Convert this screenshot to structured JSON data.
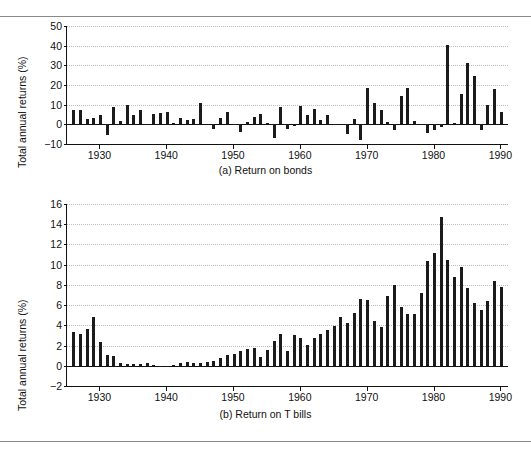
{
  "page": {
    "header_remnant": "",
    "background": "#ffffff",
    "bar_color": "#1b1b1b",
    "grid_color": "#bdbdbd",
    "axis_color": "#111111"
  },
  "chart_data": [
    {
      "id": "return-on-bonds",
      "type": "bar",
      "title": "",
      "caption": "(a)  Return on bonds",
      "xlabel": "",
      "ylabel": "Total annual returns (%)",
      "ylim": [
        -10,
        50
      ],
      "yticks": [
        -10,
        0,
        10,
        20,
        30,
        40,
        50
      ],
      "xlim": [
        1925,
        1991
      ],
      "xticks": [
        1930,
        1940,
        1950,
        1960,
        1970,
        1980,
        1990
      ],
      "grid": true,
      "legend": "none",
      "x": [
        1926,
        1927,
        1928,
        1929,
        1930,
        1931,
        1932,
        1933,
        1934,
        1935,
        1936,
        1937,
        1938,
        1939,
        1940,
        1941,
        1942,
        1943,
        1944,
        1945,
        1946,
        1947,
        1948,
        1949,
        1950,
        1951,
        1952,
        1953,
        1954,
        1955,
        1956,
        1957,
        1958,
        1959,
        1960,
        1961,
        1962,
        1963,
        1964,
        1965,
        1966,
        1967,
        1968,
        1969,
        1970,
        1971,
        1972,
        1973,
        1974,
        1975,
        1976,
        1977,
        1978,
        1979,
        1980,
        1981,
        1982,
        1983,
        1984,
        1985,
        1986,
        1987,
        1988,
        1989,
        1990
      ],
      "values": [
        7.4,
        7.4,
        2.8,
        3.3,
        4.7,
        -5.3,
        8.8,
        1.8,
        10.0,
        5.0,
        7.5,
        0.2,
        5.5,
        6.0,
        6.1,
        0.9,
        3.2,
        2.1,
        2.8,
        10.7,
        -0.1,
        -2.6,
        3.4,
        6.5,
        0.1,
        -3.9,
        1.2,
        3.5,
        5.4,
        0.5,
        -6.8,
        8.7,
        -2.2,
        -1.0,
        9.1,
        4.8,
        8.0,
        2.2,
        4.8,
        -0.5,
        0.2,
        -5.0,
        2.6,
        -8.1,
        18.4,
        11.0,
        7.3,
        1.1,
        -3.1,
        14.6,
        18.7,
        1.7,
        -0.1,
        -4.2,
        -2.8,
        -1.2,
        40.4,
        0.7,
        15.4,
        31.0,
        24.5,
        -2.7,
        9.7,
        18.1,
        6.2
      ]
    },
    {
      "id": "return-on-t-bills",
      "type": "bar",
      "title": "",
      "caption": "(b)  Return on T bills",
      "xlabel": "",
      "ylabel": "Total annual returns (%)",
      "ylim": [
        -2,
        16
      ],
      "yticks": [
        -2,
        0,
        2,
        4,
        6,
        8,
        10,
        12,
        14,
        16
      ],
      "xlim": [
        1925,
        1991
      ],
      "xticks": [
        1930,
        1940,
        1950,
        1960,
        1970,
        1980,
        1990
      ],
      "grid": true,
      "legend": "none",
      "x": [
        1926,
        1927,
        1928,
        1929,
        1930,
        1931,
        1932,
        1933,
        1934,
        1935,
        1936,
        1937,
        1938,
        1939,
        1940,
        1941,
        1942,
        1943,
        1944,
        1945,
        1946,
        1947,
        1948,
        1949,
        1950,
        1951,
        1952,
        1953,
        1954,
        1955,
        1956,
        1957,
        1958,
        1959,
        1960,
        1961,
        1962,
        1963,
        1964,
        1965,
        1966,
        1967,
        1968,
        1969,
        1970,
        1971,
        1972,
        1973,
        1974,
        1975,
        1976,
        1977,
        1978,
        1979,
        1980,
        1981,
        1982,
        1983,
        1984,
        1985,
        1986,
        1987,
        1988,
        1989,
        1990
      ],
      "values": [
        3.3,
        3.1,
        3.6,
        4.8,
        2.4,
        1.1,
        1.0,
        0.3,
        0.2,
        0.2,
        0.2,
        0.3,
        0.1,
        0.0,
        0.0,
        0.1,
        0.3,
        0.4,
        0.3,
        0.3,
        0.4,
        0.5,
        0.8,
        1.1,
        1.2,
        1.5,
        1.7,
        1.8,
        0.9,
        1.6,
        2.5,
        3.1,
        1.5,
        3.0,
        2.7,
        2.1,
        2.7,
        3.1,
        3.5,
        3.9,
        4.8,
        4.2,
        5.2,
        6.6,
        6.5,
        4.4,
        3.8,
        6.9,
        8.0,
        5.8,
        5.1,
        5.1,
        7.2,
        10.4,
        11.2,
        14.7,
        10.5,
        8.8,
        9.8,
        7.7,
        6.2,
        5.5,
        6.4,
        8.4,
        7.8
      ]
    }
  ]
}
